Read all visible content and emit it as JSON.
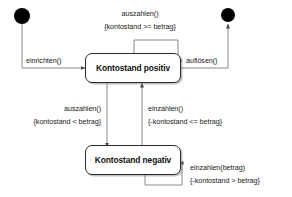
{
  "diagram": {
    "type": "uml-state-machine",
    "background_color": "#ffffff",
    "line_color": "#4a4a4a",
    "text_color": "#1a1a1a",
    "states": [
      {
        "id": "initial",
        "kind": "initial-state",
        "label": ""
      },
      {
        "id": "kontostand_positiv",
        "kind": "state",
        "label": "Kontostand positiv"
      },
      {
        "id": "kontostand_negativ",
        "kind": "state",
        "label": "Kontostand negativ"
      },
      {
        "id": "final",
        "kind": "final-state",
        "label": ""
      }
    ],
    "transitions": [
      {
        "id": "t-einrichten",
        "from": "initial",
        "to": "kontostand_positiv",
        "event": "einrichten()",
        "guard": ""
      },
      {
        "id": "t-aufloesen",
        "from": "kontostand_positiv",
        "to": "final",
        "event": "auflösen()",
        "guard": ""
      },
      {
        "id": "t-auszahlen-self",
        "from": "kontostand_positiv",
        "to": "kontostand_positiv",
        "event": "auszahlen()",
        "guard": "{kontostand >= betrag}"
      },
      {
        "id": "t-auszahlen-down",
        "from": "kontostand_positiv",
        "to": "kontostand_negativ",
        "event": "auszahlen()",
        "guard": "{kontostand < betrag}"
      },
      {
        "id": "t-einzahlen-up",
        "from": "kontostand_negativ",
        "to": "kontostand_positiv",
        "event": "einzahlen()",
        "guard": "{-kontostand <= betrag}"
      },
      {
        "id": "t-einzahlen-self",
        "from": "kontostand_negativ",
        "to": "kontostand_negativ",
        "event": "einzahlen(betrag)",
        "guard": "{-kontostand > betrag}"
      }
    ]
  }
}
